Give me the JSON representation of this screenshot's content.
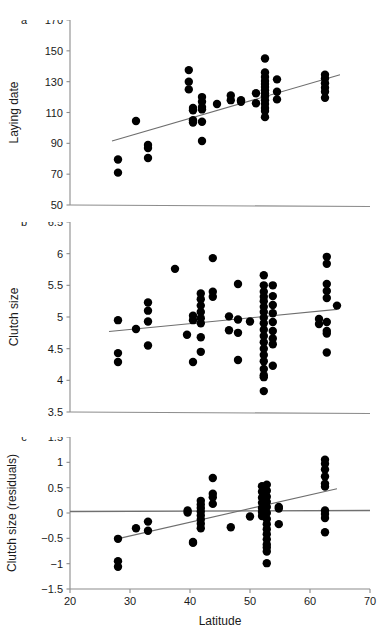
{
  "figure": {
    "panels": [
      {
        "letter": "a",
        "ylabel": "Laying date",
        "yticks": [
          50,
          70,
          90,
          110,
          130,
          150,
          170
        ],
        "ylim": [
          50,
          170
        ],
        "xlim": [
          20,
          70
        ],
        "fit": {
          "x0": 27.0,
          "y0": 91.5,
          "x1": 65.0,
          "y1": 134.5
        }
      },
      {
        "letter": "b",
        "ylabel": "Clutch size",
        "yticks": [
          3.5,
          4,
          4.5,
          5,
          5.5,
          6,
          6.5
        ],
        "ylim": [
          3.5,
          6.5
        ],
        "xlim": [
          20,
          70
        ],
        "fit": {
          "x0": 26.5,
          "y0": 4.77,
          "x1": 64.5,
          "y1": 5.12
        }
      },
      {
        "letter": "c",
        "ylabel": "Clutch size (residuals)",
        "yticks": [
          -1.5,
          -1,
          -0.5,
          0,
          0.5,
          1,
          1.5
        ],
        "ylim": [
          -1.5,
          1.5
        ],
        "xlim": [
          20,
          70
        ],
        "fit": {
          "x0": 27.5,
          "y0": -0.52,
          "x1": 64.5,
          "y1": 0.48
        },
        "zero_reference": 0.03
      }
    ],
    "xlabel": "Latitude",
    "xticks": [
      20,
      30,
      40,
      50,
      60,
      70
    ],
    "colors": {
      "point": "#000000",
      "axis": "#8c8c8c",
      "fit_line": "#6e6e6e",
      "background": "#ffffff"
    }
  },
  "chart_data": {
    "type": "scatter",
    "title": "",
    "xlabel": "Latitude",
    "xlim": [
      20,
      70
    ],
    "xticks": [
      20,
      30,
      40,
      50,
      60,
      70
    ],
    "grid": false,
    "legend": "none",
    "panels": [
      {
        "label": "a",
        "ylabel": "Laying date",
        "ylim": [
          50,
          170
        ],
        "yticks": [
          50,
          70,
          90,
          110,
          130,
          150,
          170
        ],
        "trendline": {
          "x": [
            27.0,
            65.0
          ],
          "y": [
            91.5,
            134.5
          ]
        },
        "points": [
          [
            28.0,
            79.5
          ],
          [
            28.0,
            71.0
          ],
          [
            31.0,
            104.5
          ],
          [
            33.0,
            89.0
          ],
          [
            33.0,
            87.0
          ],
          [
            33.0,
            80.5
          ],
          [
            39.8,
            137.5
          ],
          [
            39.8,
            130.0
          ],
          [
            39.8,
            125.0
          ],
          [
            40.5,
            113.0
          ],
          [
            40.5,
            111.5
          ],
          [
            40.5,
            105.0
          ],
          [
            40.5,
            103.5
          ],
          [
            42.0,
            120.0
          ],
          [
            42.0,
            117.0
          ],
          [
            42.0,
            113.5
          ],
          [
            42.0,
            112.0
          ],
          [
            42.0,
            104.0
          ],
          [
            42.0,
            91.5
          ],
          [
            44.5,
            115.5
          ],
          [
            46.8,
            121.0
          ],
          [
            46.8,
            118.0
          ],
          [
            48.5,
            118.0
          ],
          [
            48.5,
            117.0
          ],
          [
            51.0,
            122.5
          ],
          [
            51.0,
            116.0
          ],
          [
            52.5,
            145.0
          ],
          [
            52.5,
            136.0
          ],
          [
            52.5,
            133.0
          ],
          [
            52.5,
            130.5
          ],
          [
            52.5,
            128.5
          ],
          [
            52.5,
            126.5
          ],
          [
            52.5,
            124.5
          ],
          [
            52.5,
            122.5
          ],
          [
            52.5,
            120.5
          ],
          [
            52.5,
            118.0
          ],
          [
            52.5,
            115.5
          ],
          [
            52.5,
            113.0
          ],
          [
            52.5,
            111.0
          ],
          [
            52.5,
            107.0
          ],
          [
            54.5,
            131.5
          ],
          [
            54.5,
            123.5
          ],
          [
            54.5,
            118.5
          ],
          [
            62.5,
            134.5
          ],
          [
            62.5,
            132.0
          ],
          [
            62.5,
            129.0
          ],
          [
            62.5,
            126.0
          ],
          [
            62.5,
            123.5
          ],
          [
            62.5,
            119.5
          ]
        ]
      },
      {
        "label": "b",
        "ylabel": "Clutch size",
        "ylim": [
          3.5,
          6.5
        ],
        "yticks": [
          3.5,
          4,
          4.5,
          5,
          5.5,
          6,
          6.5
        ],
        "trendline": {
          "x": [
            26.5,
            64.5
          ],
          "y": [
            4.77,
            5.12
          ]
        },
        "points": [
          [
            28.0,
            4.95
          ],
          [
            28.0,
            4.43
          ],
          [
            28.0,
            4.29
          ],
          [
            31.0,
            4.81
          ],
          [
            33.0,
            5.23
          ],
          [
            33.0,
            5.1
          ],
          [
            33.0,
            4.93
          ],
          [
            33.0,
            4.55
          ],
          [
            37.5,
            5.76
          ],
          [
            39.5,
            4.72
          ],
          [
            40.5,
            5.02
          ],
          [
            40.5,
            4.95
          ],
          [
            40.5,
            4.29
          ],
          [
            41.8,
            5.37
          ],
          [
            41.8,
            5.28
          ],
          [
            41.8,
            5.18
          ],
          [
            41.8,
            5.08
          ],
          [
            41.8,
            4.98
          ],
          [
            41.8,
            4.9
          ],
          [
            41.8,
            4.68
          ],
          [
            41.8,
            4.45
          ],
          [
            43.8,
            5.93
          ],
          [
            43.8,
            5.4
          ],
          [
            43.8,
            5.32
          ],
          [
            46.5,
            5.01
          ],
          [
            46.5,
            4.79
          ],
          [
            48.0,
            5.52
          ],
          [
            48.0,
            4.96
          ],
          [
            48.0,
            4.75
          ],
          [
            48.0,
            4.32
          ],
          [
            50.0,
            4.93
          ],
          [
            52.3,
            5.66
          ],
          [
            52.3,
            5.5
          ],
          [
            52.3,
            5.4
          ],
          [
            52.3,
            5.32
          ],
          [
            52.3,
            5.25
          ],
          [
            52.3,
            5.16
          ],
          [
            52.3,
            5.08
          ],
          [
            52.3,
            4.99
          ],
          [
            52.3,
            4.9
          ],
          [
            52.3,
            4.8
          ],
          [
            52.3,
            4.7
          ],
          [
            52.3,
            4.6
          ],
          [
            52.3,
            4.5
          ],
          [
            52.3,
            4.4
          ],
          [
            52.3,
            4.3
          ],
          [
            52.3,
            4.18
          ],
          [
            52.3,
            4.08
          ],
          [
            52.3,
            4.05
          ],
          [
            52.3,
            3.83
          ],
          [
            53.8,
            5.5
          ],
          [
            53.8,
            5.33
          ],
          [
            53.8,
            5.19
          ],
          [
            53.8,
            5.06
          ],
          [
            53.8,
            4.92
          ],
          [
            53.8,
            4.78
          ],
          [
            53.8,
            4.66
          ],
          [
            53.8,
            4.57
          ],
          [
            53.8,
            4.23
          ],
          [
            61.5,
            4.97
          ],
          [
            61.5,
            4.89
          ],
          [
            62.8,
            5.95
          ],
          [
            62.8,
            5.84
          ],
          [
            62.8,
            5.52
          ],
          [
            62.8,
            5.41
          ],
          [
            62.8,
            5.3
          ],
          [
            62.8,
            4.92
          ],
          [
            62.8,
            4.78
          ],
          [
            62.8,
            4.74
          ],
          [
            62.8,
            4.44
          ],
          [
            64.5,
            5.18
          ]
        ]
      },
      {
        "label": "c",
        "ylabel": "Clutch size (residuals)",
        "ylim": [
          -1.5,
          1.5
        ],
        "yticks": [
          -1.5,
          -1,
          -0.5,
          0,
          0.5,
          1,
          1.5
        ],
        "trendline": {
          "x": [
            27.5,
            64.5
          ],
          "y": [
            -0.52,
            0.48
          ]
        },
        "zero_line": 0.03,
        "points": [
          [
            28.0,
            -0.51
          ],
          [
            28.0,
            -0.95
          ],
          [
            28.0,
            -1.06
          ],
          [
            31.0,
            -0.3
          ],
          [
            33.0,
            -0.17
          ],
          [
            33.0,
            -0.35
          ],
          [
            39.6,
            0.05
          ],
          [
            39.6,
            0.01
          ],
          [
            40.5,
            -0.57
          ],
          [
            40.5,
            -0.59
          ],
          [
            41.8,
            0.24
          ],
          [
            41.8,
            0.17
          ],
          [
            41.8,
            0.1
          ],
          [
            41.8,
            0.03
          ],
          [
            41.8,
            -0.05
          ],
          [
            41.8,
            -0.13
          ],
          [
            41.8,
            -0.21
          ],
          [
            41.8,
            -0.3
          ],
          [
            43.8,
            0.69
          ],
          [
            43.8,
            0.38
          ],
          [
            43.8,
            0.31
          ],
          [
            43.8,
            0.18
          ],
          [
            46.8,
            -0.28
          ],
          [
            50.0,
            -0.07
          ],
          [
            52.0,
            0.53
          ],
          [
            52.0,
            0.42
          ],
          [
            52.0,
            0.3
          ],
          [
            52.0,
            0.2
          ],
          [
            52.0,
            0.1
          ],
          [
            52.0,
            0.02
          ],
          [
            52.0,
            -0.06
          ],
          [
            52.8,
            0.56
          ],
          [
            52.8,
            0.44
          ],
          [
            52.8,
            0.32
          ],
          [
            52.8,
            0.22
          ],
          [
            52.8,
            0.12
          ],
          [
            52.8,
            0.0
          ],
          [
            52.8,
            -0.12
          ],
          [
            52.8,
            -0.22
          ],
          [
            52.8,
            -0.32
          ],
          [
            52.8,
            -0.42
          ],
          [
            52.8,
            -0.52
          ],
          [
            52.8,
            -0.62
          ],
          [
            52.8,
            -0.68
          ],
          [
            52.8,
            -0.76
          ],
          [
            52.8,
            -0.99
          ],
          [
            54.8,
            0.12
          ],
          [
            54.8,
            0.09
          ],
          [
            54.8,
            -0.22
          ],
          [
            62.5,
            1.05
          ],
          [
            62.5,
            0.97
          ],
          [
            62.5,
            0.86
          ],
          [
            62.5,
            0.72
          ],
          [
            62.5,
            0.58
          ],
          [
            62.5,
            0.52
          ],
          [
            62.5,
            0.05
          ],
          [
            62.5,
            -0.02
          ],
          [
            62.5,
            -0.1
          ],
          [
            62.5,
            -0.38
          ]
        ]
      }
    ]
  }
}
